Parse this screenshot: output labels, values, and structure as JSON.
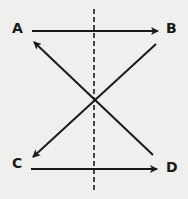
{
  "diagram": {
    "nodes": [
      {
        "id": "A",
        "label": "A",
        "x": 17,
        "y": 33
      },
      {
        "id": "B",
        "label": "B",
        "x": 171,
        "y": 33
      },
      {
        "id": "C",
        "label": "C",
        "x": 17,
        "y": 168
      },
      {
        "id": "D",
        "label": "D",
        "x": 171,
        "y": 172
      }
    ],
    "edges": [
      {
        "from": "A",
        "to": "B",
        "style": "solid",
        "arrow": "end"
      },
      {
        "from": "B",
        "to": "C",
        "style": "solid",
        "arrow": "end"
      },
      {
        "from": "D",
        "to": "A",
        "style": "solid",
        "arrow": "end"
      },
      {
        "from": "C",
        "to": "D",
        "style": "solid",
        "arrow": "end"
      }
    ],
    "axis_line": {
      "style": "dashed",
      "orientation": "vertical"
    },
    "colors": {
      "line": "#1a1a1a",
      "background": "#efefed"
    }
  }
}
